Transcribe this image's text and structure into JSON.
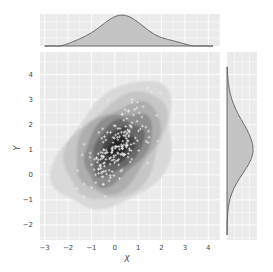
{
  "chart_data": {
    "type": "jointplot-kde",
    "title": "",
    "xlabel": "X",
    "ylabel": "Y",
    "xlim": [
      -3.2,
      4.5
    ],
    "ylim": [
      -2.6,
      4.9
    ],
    "x_ticks": [
      -3,
      -2,
      -1,
      0,
      1,
      2,
      3,
      4
    ],
    "y_ticks": [
      -2,
      -1,
      0,
      1,
      2,
      3,
      4
    ],
    "grid": true,
    "style": "darkgrid (light gray background, white gridlines)",
    "main_panel": {
      "type": "kde2d-filled-contour-with-scatter",
      "colormap": "grays",
      "density_center": [
        0.2,
        1.1
      ],
      "correlation": "positive",
      "contour_levels": 7,
      "scatter_marker": "+",
      "scatter_color": "#ffffff",
      "scatter_points_approx": 200
    },
    "top_marginal": {
      "type": "kde",
      "variable": "X",
      "peak_x": 0.2,
      "support": [
        -3,
        4.2
      ],
      "fill": "#bdbdbd",
      "line": "#555555"
    },
    "right_marginal": {
      "type": "kde",
      "variable": "Y",
      "peak_y": 1.0,
      "support": [
        -2.4,
        4.3
      ],
      "fill": "#bdbdbd",
      "line": "#555555"
    },
    "colors": {
      "panel_bg": "#ebebeb",
      "grid": "#ffffff",
      "marginal_fill": "#c4c4c4",
      "marginal_line": "#5a5a5a"
    }
  }
}
